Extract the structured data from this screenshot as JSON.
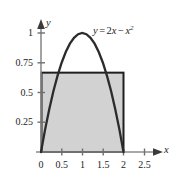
{
  "figure": {
    "background_color": "#ffffff",
    "curve_color": "#2b2b2b",
    "axis_color": "#8d8d8d",
    "fill_color": "#d2d2d2",
    "rect_border_color": "#1f1f1f",
    "equation": {
      "lhs": "y",
      "equals": "=",
      "term1_coef": "2",
      "term1_var": "x",
      "minus": "−",
      "term2_var": "x",
      "term2_exp": "2",
      "plain": "y = 2x − x²"
    },
    "axis_labels": {
      "x": "x",
      "y": "y"
    }
  },
  "chart_data": {
    "type": "line",
    "title": "",
    "xlabel": "x",
    "ylabel": "y",
    "xlim": [
      -0.12,
      2.8
    ],
    "ylim": [
      -0.06,
      1.12
    ],
    "grid": false,
    "legend": "none",
    "x_ticks": [
      0,
      0.5,
      1,
      1.5,
      2,
      2.5
    ],
    "x_tick_labels": [
      "0",
      "0.5",
      "1",
      "1.5",
      "2",
      "2.5"
    ],
    "y_ticks": [
      0,
      0.25,
      0.5,
      0.75,
      1
    ],
    "y_tick_labels": [
      "0",
      "0.25",
      "0.5",
      "0.75",
      "1"
    ],
    "series": [
      {
        "name": "y = 2x - x^2",
        "type": "line",
        "annotation": "y = 2x − x²",
        "x": [
          0,
          0.1,
          0.2,
          0.3,
          0.4,
          0.5,
          0.6,
          0.7,
          0.8,
          0.9,
          1,
          1.1,
          1.2,
          1.3,
          1.4,
          1.5,
          1.6,
          1.7,
          1.8,
          1.9,
          2
        ],
        "y": [
          0,
          0.19,
          0.36,
          0.51,
          0.64,
          0.75,
          0.84,
          0.91,
          0.96,
          0.99,
          1,
          0.99,
          0.96,
          0.91,
          0.84,
          0.75,
          0.64,
          0.51,
          0.36,
          0.19,
          0
        ]
      }
    ],
    "shaded_rectangle": {
      "name": "mean-value-rectangle",
      "x_start": 0,
      "x_end": 2,
      "y_bottom": 0,
      "y_top": 0.6667,
      "fill": "#d2d2d2",
      "border": "#1f1f1f"
    },
    "annotations": [
      {
        "text": "y = 2x − x²",
        "x": 1.28,
        "y": 1.0
      }
    ]
  }
}
